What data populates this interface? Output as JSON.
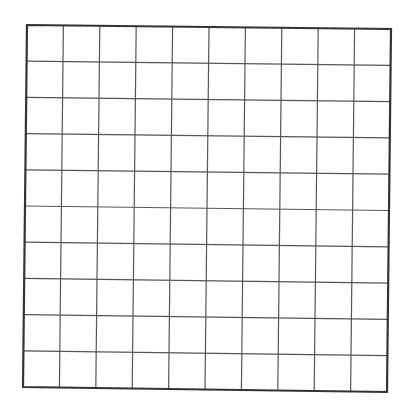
{
  "grid": {
    "rows": 10,
    "cols": 10,
    "corners": {
      "top_left": [
        27,
        25
      ],
      "top_right": [
        391,
        29
      ],
      "bottom_right": [
        387,
        392
      ],
      "bottom_left": [
        23,
        387
      ]
    },
    "line_color": "#555555",
    "border_color": "#333333",
    "background": "#ffffff"
  }
}
